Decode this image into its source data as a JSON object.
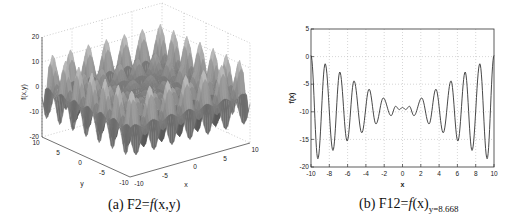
{
  "chart_data": [
    {
      "type": "surface3d",
      "title": "",
      "caption": {
        "prefix": "(a) F2=",
        "func": "f",
        "args": "(x,y)"
      },
      "xlabel": "x",
      "ylabel": "y",
      "zlabel": "f(x,y)",
      "x_ticks": [
        "-10",
        "-5",
        "0",
        "5",
        "10"
      ],
      "y_ticks": [
        "10",
        "5",
        "0",
        "-5",
        "-10"
      ],
      "z_ticks": [
        "20",
        "10",
        "0",
        "-10",
        "-20"
      ],
      "xlim": [
        -10,
        10
      ],
      "ylim": [
        -10,
        10
      ],
      "zlim": [
        -20,
        20
      ],
      "grid": true,
      "colormap": "gray",
      "description": "Oscillating multimodal surface with peaks and valleys growing toward the domain edges, flat near center"
    },
    {
      "type": "line",
      "title": "",
      "caption": {
        "prefix": "(b) F12=",
        "func": "f",
        "args": "(x)",
        "sub": "y=8.668"
      },
      "xlabel": "x",
      "ylabel": "f(x)",
      "x_ticks": [
        "-10",
        "-8",
        "-6",
        "-4",
        "-2",
        "0",
        "2",
        "4",
        "6",
        "8",
        "10"
      ],
      "y_ticks": [
        "5",
        "0",
        "-5",
        "-10",
        "-15",
        "-20"
      ],
      "xlim": [
        -10,
        10
      ],
      "ylim": [
        -20,
        5
      ],
      "grid": true,
      "series": [
        {
          "name": "f(x)",
          "x": [
            -10,
            -9.25,
            -8.45,
            -7.6,
            -6.85,
            -6.05,
            -5.3,
            -4.45,
            -3.65,
            -2.9,
            -2.1,
            -1.25,
            -0.75,
            -0.35,
            0,
            0.35,
            0.75,
            1.25,
            2.1,
            2.9,
            3.65,
            4.45,
            5.3,
            6.05,
            6.85,
            7.6,
            8.45,
            9.25,
            10
          ],
          "y": [
            0.2,
            -18.5,
            -1.3,
            -17.0,
            -2.8,
            -15.3,
            -4.4,
            -13.8,
            -5.9,
            -12.2,
            -7.5,
            -10.7,
            -9.0,
            -9.6,
            -9.2,
            -9.6,
            -9.0,
            -10.7,
            -7.5,
            -12.2,
            -5.9,
            -13.8,
            -4.4,
            -15.3,
            -2.8,
            -17.0,
            -1.3,
            -18.5,
            0.2
          ]
        }
      ]
    }
  ]
}
